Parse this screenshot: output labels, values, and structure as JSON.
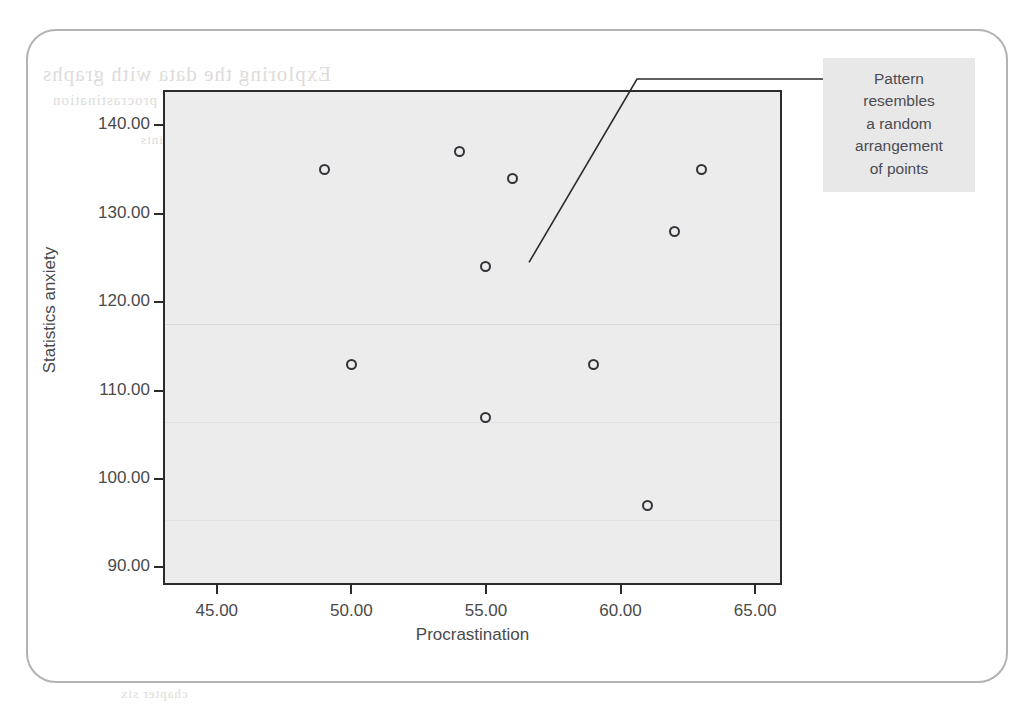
{
  "chart_data": {
    "type": "scatter",
    "title": "",
    "xlabel": "Procrastination",
    "ylabel": "Statistics anxiety",
    "xlim": [
      43,
      66
    ],
    "ylim": [
      88,
      144
    ],
    "xticks": [
      "45.00",
      "50.00",
      "55.00",
      "60.00",
      "65.00"
    ],
    "xtick_values": [
      45,
      50,
      55,
      60,
      65
    ],
    "yticks": [
      "90.00",
      "100.00",
      "110.00",
      "120.00",
      "130.00",
      "140.00"
    ],
    "ytick_values": [
      90,
      100,
      110,
      120,
      130,
      140
    ],
    "grid": false,
    "legend": null,
    "marker_style": "open-circle",
    "points": [
      {
        "x": 49,
        "y": 135
      },
      {
        "x": 54,
        "y": 137
      },
      {
        "x": 56,
        "y": 134
      },
      {
        "x": 63,
        "y": 135
      },
      {
        "x": 62,
        "y": 128
      },
      {
        "x": 55,
        "y": 124
      },
      {
        "x": 50,
        "y": 113
      },
      {
        "x": 59,
        "y": 113
      },
      {
        "x": 55,
        "y": 107
      },
      {
        "x": 61,
        "y": 97
      }
    ],
    "annotations": [
      {
        "name": "pattern-callout",
        "lines": [
          "Pattern",
          "resembles",
          "a random",
          "arrangement",
          "of points"
        ],
        "text": "Pattern resembles a random arrangement of points",
        "leader_from": {
          "x": 56.6,
          "y": 124.5
        }
      }
    ]
  },
  "colors": {
    "panel_fill": "#ececec",
    "axis_line": "#2b2b2b",
    "marker_stroke": "#33333a",
    "tick_text": "#4a4a4a",
    "annotation_fill": "#e8e8e8",
    "annotation_text": "#4b4b52",
    "card_border": "#b5b3b1",
    "page_background": "#ffffff"
  },
  "bleed_through": {
    "line1": "Exploring the data with graphs",
    "line2": "the scatterplot of anxiety against procrastination",
    "line3": "random arrangement of points",
    "line4": "no relationship between the variables",
    "line5": "correlation close to zero",
    "line6": "chapter six"
  }
}
